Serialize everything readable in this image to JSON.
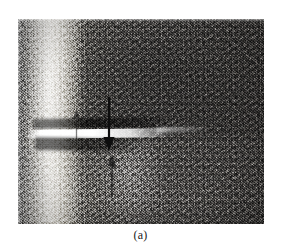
{
  "figure": {
    "caption": "(a)",
    "panel_label": "(a)",
    "image_type": "grayscale-micrograph",
    "background_color": "#ffffff",
    "caption_color": "#1a1a1a"
  },
  "micrograph": {
    "alt_description": "Grayscale metallographic micrograph showing a bright horizontal crack / white line across the middle of a granular etched steel microstructure, with a bright vertical band along the left side and a darker speckled field on the right.",
    "frame": {
      "left": 18,
      "top": 19,
      "width": 246,
      "height": 205
    },
    "regions": [
      {
        "name": "bright-vertical-band",
        "tone": "light",
        "position": "left"
      },
      {
        "name": "granular-dark-field",
        "tone": "dark",
        "position": "right"
      },
      {
        "name": "bright-horizontal-crack",
        "tone": "white",
        "position": "center-middle"
      },
      {
        "name": "lower-diagonal-flare",
        "tone": "light",
        "position": "lower-center"
      }
    ],
    "tones": {
      "lightest": "#e8e5dd",
      "light": "#c3c0b8",
      "mid": "#8d8d8d",
      "dark": "#5c5a58",
      "darkest": "#3a3836"
    }
  },
  "annotations": {
    "arrows": [
      {
        "name": "arrow-down-main",
        "direction": "down",
        "color": "#111111",
        "points_at": "bright horizontal crack",
        "prominence": "strong"
      },
      {
        "name": "arrow-up-lower",
        "direction": "up",
        "color": "#1a1a1a",
        "points_at": "bright horizontal crack from below",
        "prominence": "faint"
      },
      {
        "name": "arrow-small-left",
        "direction": "up",
        "color": "#1a1a1a",
        "points_at": "left end of crack",
        "prominence": "very faint"
      }
    ]
  }
}
